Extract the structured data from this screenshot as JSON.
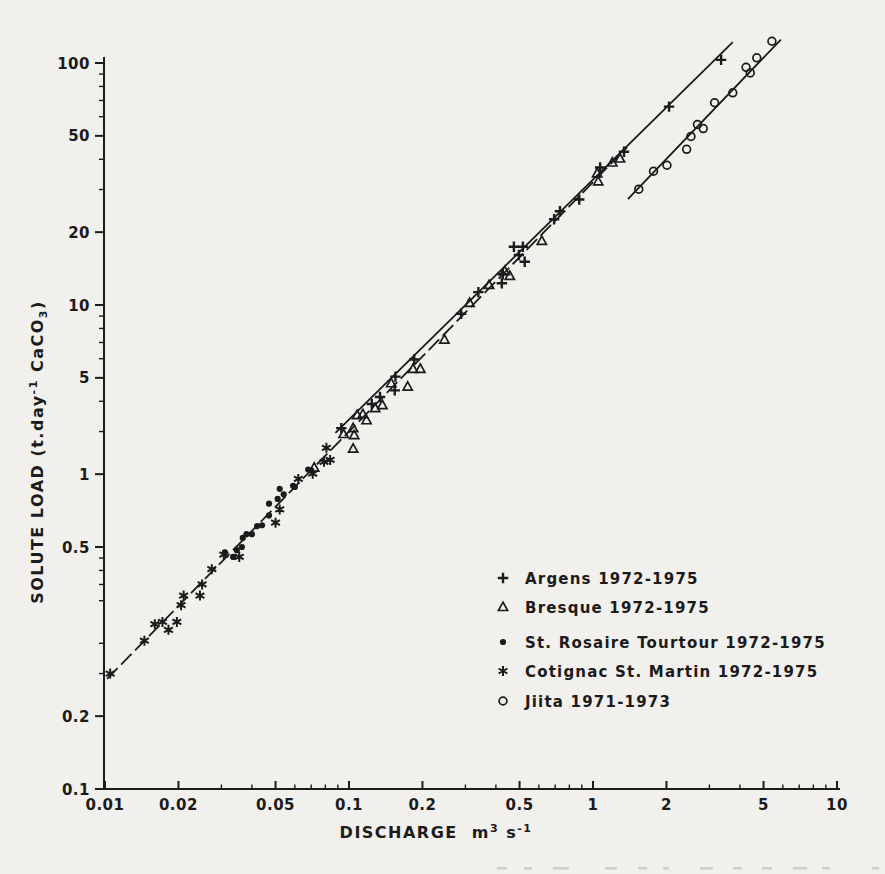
{
  "page": {
    "background": "#f2f0ec",
    "ink": "#1b1b1b"
  },
  "chart_data": {
    "type": "scatter",
    "title": "",
    "grid": false,
    "legend_position": "inside-lower-right",
    "colors": {
      "ink": "#1b1b1b",
      "background": "#f2f0ec"
    },
    "x_axis": {
      "scale": "log",
      "range": [
        0.01,
        10
      ],
      "title_word": "DISCHARGE",
      "unit_parts": {
        "base1": "m",
        "exp1": "3",
        "base2": " s",
        "exp2": "-1"
      },
      "major_ticks": [
        {
          "label": "0.01",
          "at": 0.01
        },
        {
          "label": "0.02",
          "at": 0.02
        },
        {
          "label": "0.05",
          "at": 0.05
        },
        {
          "label": "0.1",
          "at": 0.1
        },
        {
          "label": "0.2",
          "at": 0.2
        },
        {
          "label": "0.5",
          "at": 0.5
        },
        {
          "label": "1",
          "at": 1
        },
        {
          "label": "2",
          "at": 2
        },
        {
          "label": "5",
          "at": 5
        },
        {
          "label": "10",
          "at": 10
        }
      ]
    },
    "y_axis": {
      "scale": "log",
      "range": [
        0.1,
        130
      ],
      "title_parts": {
        "pre": "SOLUTE LOAD (t.day",
        "sup": "-1",
        "mid": " CaCO",
        "sub": "3",
        "post": ")"
      },
      "major_ticks": [
        {
          "label": "100",
          "at": 100
        },
        {
          "label": "50",
          "at": 50
        },
        {
          "label": "20",
          "at": 20
        },
        {
          "label": "10",
          "at": 10
        },
        {
          "label": "5",
          "at": 5
        },
        {
          "label": "1",
          "at": 2
        },
        {
          "label": "0.5",
          "at": 1
        },
        {
          "label": "0.2",
          "at": 0.2
        },
        {
          "label": "0.1",
          "at": 0.1
        }
      ]
    },
    "series": [
      {
        "name": "Argens",
        "legend_label": "Argens 1972-1975",
        "marker": "plus",
        "points": [
          [
            0.093,
            3.1
          ],
          [
            0.124,
            3.9
          ],
          [
            0.134,
            4.17
          ],
          [
            0.154,
            4.44
          ],
          [
            0.155,
            5.06
          ],
          [
            0.185,
            5.95
          ],
          [
            0.288,
            9.2
          ],
          [
            0.339,
            11.3
          ],
          [
            0.423,
            12.3
          ],
          [
            0.427,
            13.4
          ],
          [
            0.474,
            17.4
          ],
          [
            0.497,
            16.1
          ],
          [
            0.516,
            17.4
          ],
          [
            0.525,
            15.1
          ],
          [
            0.693,
            22.6
          ],
          [
            0.732,
            24.4
          ],
          [
            0.878,
            27.3
          ],
          [
            1.07,
            37.0
          ],
          [
            1.34,
            43.0
          ],
          [
            2.05,
            66.0
          ],
          [
            3.35,
            103.0
          ]
        ]
      },
      {
        "name": "Bresque",
        "legend_label": "Bresque 1972-1975",
        "marker": "triangle-open",
        "points": [
          [
            0.072,
            2.13
          ],
          [
            0.095,
            2.93
          ],
          [
            0.104,
            2.55
          ],
          [
            0.105,
            2.9
          ],
          [
            0.104,
            3.1
          ],
          [
            0.108,
            3.51
          ],
          [
            0.114,
            3.54
          ],
          [
            0.118,
            3.34
          ],
          [
            0.128,
            3.75
          ],
          [
            0.137,
            3.86
          ],
          [
            0.149,
            4.75
          ],
          [
            0.174,
            4.6
          ],
          [
            0.183,
            5.45
          ],
          [
            0.196,
            5.45
          ],
          [
            0.246,
            7.2
          ],
          [
            0.312,
            10.2
          ],
          [
            0.375,
            12.1
          ],
          [
            0.435,
            13.8
          ],
          [
            0.456,
            13.2
          ],
          [
            0.617,
            18.4
          ],
          [
            1.04,
            35.0
          ],
          [
            1.05,
            32.4
          ],
          [
            1.2,
            38.8
          ],
          [
            1.29,
            40.3
          ]
        ]
      },
      {
        "name": "St. Rosaire Tourtour",
        "legend_label": "St. Rosaire Tourtour 1972-1975",
        "marker": "dot-filled",
        "points": [
          [
            0.031,
            0.95
          ],
          [
            0.0335,
            0.91
          ],
          [
            0.0347,
            0.97
          ],
          [
            0.0364,
            1.0
          ],
          [
            0.0367,
            1.09
          ],
          [
            0.038,
            1.13
          ],
          [
            0.04,
            1.13
          ],
          [
            0.042,
            1.22
          ],
          [
            0.044,
            1.23
          ],
          [
            0.047,
            1.35
          ],
          [
            0.047,
            1.51
          ],
          [
            0.051,
            1.58
          ],
          [
            0.052,
            1.74
          ],
          [
            0.054,
            1.65
          ],
          [
            0.059,
            1.79
          ],
          [
            0.06,
            1.77
          ],
          [
            0.068,
            2.09
          ],
          [
            0.07,
            2.07
          ]
        ]
      },
      {
        "name": "Cotignac St. Martin",
        "legend_label": "Cotignac St. Martin 1972-1975",
        "marker": "asterisk",
        "points": [
          [
            0.0105,
            0.3
          ],
          [
            0.0145,
            0.41
          ],
          [
            0.016,
            0.48
          ],
          [
            0.0172,
            0.49
          ],
          [
            0.0182,
            0.455
          ],
          [
            0.0197,
            0.49
          ],
          [
            0.0205,
            0.575
          ],
          [
            0.021,
            0.63
          ],
          [
            0.0245,
            0.63
          ],
          [
            0.025,
            0.7
          ],
          [
            0.0274,
            0.81
          ],
          [
            0.0307,
            0.93
          ],
          [
            0.0355,
            0.91
          ],
          [
            0.05,
            1.26
          ],
          [
            0.052,
            1.43
          ],
          [
            0.062,
            1.91
          ],
          [
            0.071,
            2.01
          ],
          [
            0.079,
            2.25
          ],
          [
            0.0837,
            2.29
          ],
          [
            0.0808,
            2.57
          ]
        ]
      },
      {
        "name": "Jiita",
        "legend_label": "Jiita 1971-1973",
        "marker": "circle-open",
        "points": [
          [
            1.54,
            30.1
          ],
          [
            1.77,
            35.7
          ],
          [
            2.01,
            37.8
          ],
          [
            2.42,
            44.0
          ],
          [
            2.52,
            49.7
          ],
          [
            2.68,
            55.7
          ],
          [
            2.83,
            53.6
          ],
          [
            3.15,
            68.5
          ],
          [
            3.74,
            75.3
          ],
          [
            4.24,
            96.0
          ],
          [
            4.41,
            91.0
          ],
          [
            4.69,
            105.0
          ],
          [
            5.41,
            123.0
          ]
        ]
      }
    ],
    "fit_lines": [
      {
        "name": "small-streams-fit",
        "style": "dashed",
        "from": [
          0.0102,
          0.285
        ],
        "to": [
          1.38,
          44.9
        ]
      },
      {
        "name": "argens-fit",
        "style": "solid",
        "from": [
          0.088,
          2.96
        ],
        "to": [
          3.74,
          122.0
        ]
      },
      {
        "name": "jiita-fit",
        "style": "solid",
        "from": [
          1.39,
          27.4
        ],
        "to": [
          5.89,
          125.0
        ]
      }
    ]
  }
}
